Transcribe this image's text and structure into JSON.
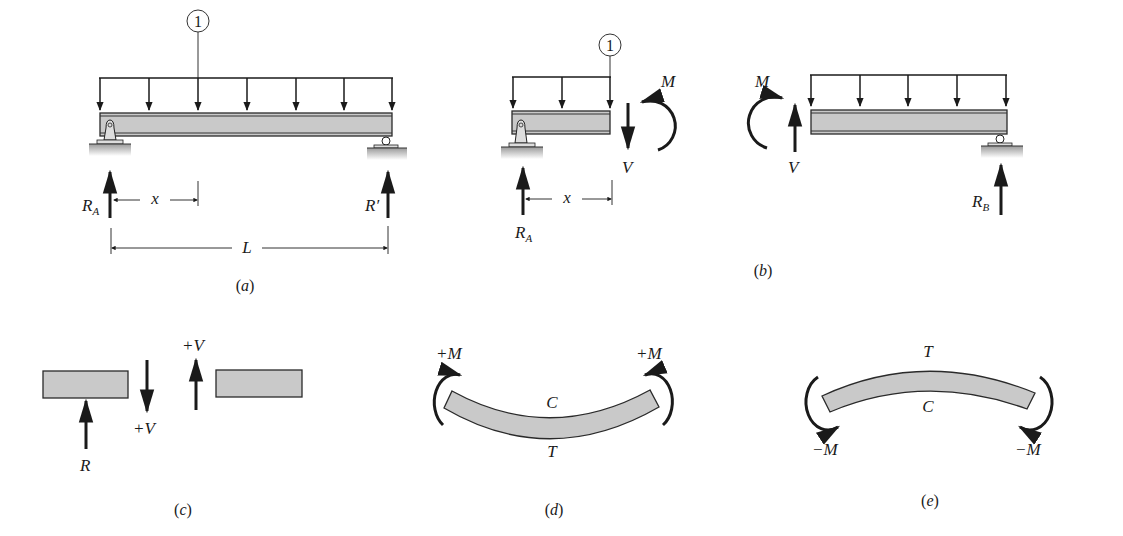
{
  "figure": {
    "panels": [
      {
        "id": "a",
        "caption": "a",
        "labels": {
          "load_tag": "1",
          "left_reaction": "R",
          "left_reaction_sub": "A",
          "position": "x",
          "right_reaction": "R′",
          "span": "L"
        }
      },
      {
        "id": "b",
        "caption": "b",
        "labels": {
          "load_tag": "1",
          "left_reaction": "R",
          "left_reaction_sub": "A",
          "position": "x",
          "left_moment": "M",
          "left_shear": "V",
          "right_moment": "M",
          "right_shear": "V",
          "right_reaction": "R",
          "right_reaction_sub": "B"
        }
      },
      {
        "id": "c",
        "caption": "c",
        "labels": {
          "reaction": "R",
          "shear_down": "+V",
          "shear_up": "+V"
        }
      },
      {
        "id": "d",
        "caption": "d",
        "labels": {
          "left_moment": "+M",
          "right_moment": "+M",
          "top": "C",
          "bottom": "T"
        }
      },
      {
        "id": "e",
        "caption": "e",
        "labels": {
          "left_moment": "−M",
          "right_moment": "−M",
          "top": "T",
          "bottom": "C"
        }
      }
    ],
    "colors": {
      "ink": "#1a1a1a",
      "beam_fill": "#c9c9c9",
      "ground": "#b5b5b5",
      "background": "#ffffff"
    }
  }
}
